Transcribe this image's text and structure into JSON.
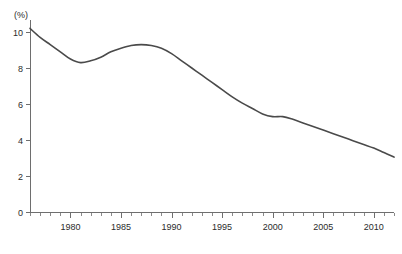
{
  "chart_data": {
    "type": "line",
    "title": "",
    "subtitle": "",
    "xlabel": "",
    "ylabel": "",
    "unit_label": "(%)",
    "xlim": [
      1976,
      2012
    ],
    "ylim": [
      0,
      10.8
    ],
    "grid": false,
    "legend": "none",
    "x_tick_labels": [
      "1980",
      "1985",
      "1990",
      "1995",
      "2000",
      "2005",
      "2010"
    ],
    "x_tick_values": [
      1980,
      1985,
      1990,
      1995,
      2000,
      2005,
      2010
    ],
    "x_minor_step": 1,
    "y_tick_labels": [
      "0",
      "2",
      "4",
      "6",
      "8",
      "10"
    ],
    "y_tick_values": [
      0,
      2,
      4,
      6,
      8,
      10
    ],
    "series": [
      {
        "name": "rate",
        "color": "#4a4a4a",
        "x": [
          1976,
          1977,
          1978,
          1979,
          1980,
          1981,
          1982,
          1983,
          1984,
          1985,
          1986,
          1987,
          1988,
          1989,
          1990,
          1991,
          1992,
          1993,
          1994,
          1995,
          1996,
          1997,
          1998,
          1999,
          2000,
          2001,
          2002,
          2003,
          2004,
          2005,
          2006,
          2007,
          2008,
          2009,
          2010,
          2011,
          2012
        ],
        "values": [
          10.2,
          9.7,
          9.3,
          8.9,
          8.5,
          8.3,
          8.4,
          8.6,
          8.9,
          9.1,
          9.25,
          9.3,
          9.25,
          9.1,
          8.8,
          8.4,
          8.0,
          7.6,
          7.2,
          6.8,
          6.4,
          6.05,
          5.75,
          5.45,
          5.3,
          5.3,
          5.15,
          4.95,
          4.75,
          4.55,
          4.35,
          4.15,
          3.95,
          3.75,
          3.55,
          3.3,
          3.05
        ]
      }
    ],
    "annotations": []
  },
  "colors": {
    "background": "#ffffff",
    "line": "#4a4a4a",
    "axis": "#6e6e6e",
    "text": "#2b2b2b"
  }
}
